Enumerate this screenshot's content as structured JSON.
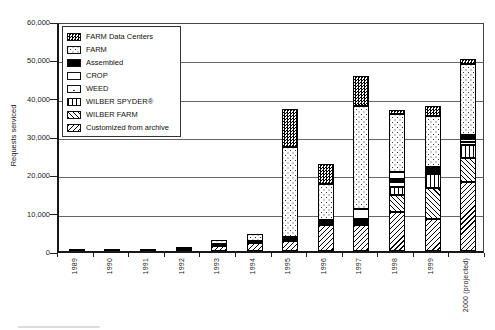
{
  "chart_data": {
    "type": "bar",
    "stacked": true,
    "title": "",
    "xlabel": "",
    "ylabel": "Requests serviced",
    "ylim": [
      0,
      60000
    ],
    "ytick_step": 10000,
    "ytick_labels": [
      "0",
      "10,000",
      "20,000",
      "30,000",
      "40,000",
      "50,000",
      "60,000"
    ],
    "grid": "horizontal",
    "legend_position": "top-left-inside",
    "colors": {
      "ink": "#000000",
      "paper": "#ffffff",
      "gridline": "#666666"
    },
    "categories": [
      "1989",
      "1990",
      "1991",
      "1992",
      "1993",
      "1994",
      "1995",
      "1996",
      "1997",
      "1998",
      "1999",
      "2000 (projected)"
    ],
    "legend": [
      {
        "key": "fdc",
        "label": "FARM Data Centers",
        "pattern": "dark-checker"
      },
      {
        "key": "farm",
        "label": "FARM",
        "pattern": "sparse-dots"
      },
      {
        "key": "assembled",
        "label": "Assembled",
        "pattern": "solid-black"
      },
      {
        "key": "crop",
        "label": "CROP",
        "pattern": "plain-white"
      },
      {
        "key": "weed",
        "label": "WEED",
        "pattern": "very-sparse-dots"
      },
      {
        "key": "spyder",
        "label": "WILBER SPYDER®",
        "pattern": "vertical-lines"
      },
      {
        "key": "wilber_farm",
        "label": "WILBER FARM",
        "pattern": "backslash-hatch"
      },
      {
        "key": "customized",
        "label": "Customized from archive",
        "pattern": "forwardslash-hatch"
      }
    ],
    "bars": [
      {
        "year": "1989",
        "total": 100,
        "segments": [
          {
            "key": "assembled",
            "value": 100
          }
        ]
      },
      {
        "year": "1990",
        "total": 500,
        "segments": [
          {
            "key": "assembled",
            "value": 500
          }
        ]
      },
      {
        "year": "1991",
        "total": 350,
        "segments": [
          {
            "key": "assembled",
            "value": 350
          }
        ]
      },
      {
        "year": "1992",
        "total": 900,
        "segments": [
          {
            "key": "assembled",
            "value": 350
          },
          {
            "key": "fdc",
            "value": 550
          }
        ]
      },
      {
        "year": "1993",
        "total": 2800,
        "segments": [
          {
            "key": "customized",
            "value": 1300
          },
          {
            "key": "assembled",
            "value": 500
          },
          {
            "key": "farm",
            "value": 1000
          }
        ]
      },
      {
        "year": "1994",
        "total": 4500,
        "segments": [
          {
            "key": "customized",
            "value": 2000
          },
          {
            "key": "assembled",
            "value": 500
          },
          {
            "key": "farm",
            "value": 2000
          }
        ]
      },
      {
        "year": "1995",
        "total": 37100,
        "segments": [
          {
            "key": "customized",
            "value": 2700
          },
          {
            "key": "assembled",
            "value": 1000
          },
          {
            "key": "farm",
            "value": 23400
          },
          {
            "key": "fdc",
            "value": 10000
          }
        ]
      },
      {
        "year": "1996",
        "total": 22600,
        "segments": [
          {
            "key": "customized",
            "value": 6900
          },
          {
            "key": "assembled",
            "value": 1100
          },
          {
            "key": "farm",
            "value": 9400
          },
          {
            "key": "fdc",
            "value": 5200
          }
        ]
      },
      {
        "year": "1997",
        "total": 45700,
        "segments": [
          {
            "key": "customized",
            "value": 6900
          },
          {
            "key": "assembled",
            "value": 1500
          },
          {
            "key": "crop",
            "value": 2600
          },
          {
            "key": "farm",
            "value": 26800
          },
          {
            "key": "fdc",
            "value": 7900
          }
        ]
      },
      {
        "year": "1998",
        "total": 36900,
        "segments": [
          {
            "key": "customized",
            "value": 10200
          },
          {
            "key": "wilber_farm",
            "value": 4300
          },
          {
            "key": "spyder",
            "value": 2200
          },
          {
            "key": "weed",
            "value": 1400
          },
          {
            "key": "assembled",
            "value": 700
          },
          {
            "key": "crop",
            "value": 1900
          },
          {
            "key": "farm",
            "value": 15100
          },
          {
            "key": "fdc",
            "value": 1100
          }
        ]
      },
      {
        "year": "1999",
        "total": 37800,
        "segments": [
          {
            "key": "customized",
            "value": 8400
          },
          {
            "key": "wilber_farm",
            "value": 8100
          },
          {
            "key": "spyder",
            "value": 3500
          },
          {
            "key": "weed",
            "value": 500
          },
          {
            "key": "assembled",
            "value": 900
          },
          {
            "key": "crop",
            "value": 600
          },
          {
            "key": "farm",
            "value": 13200
          },
          {
            "key": "fdc",
            "value": 2600
          }
        ]
      },
      {
        "year": "2000 (projected)",
        "total": 50100,
        "segments": [
          {
            "key": "customized",
            "value": 17900
          },
          {
            "key": "wilber_farm",
            "value": 6300
          },
          {
            "key": "spyder",
            "value": 3500
          },
          {
            "key": "weed",
            "value": 800
          },
          {
            "key": "crop",
            "value": 700
          },
          {
            "key": "assembled",
            "value": 1000
          },
          {
            "key": "farm",
            "value": 18500
          },
          {
            "key": "fdc",
            "value": 1400
          }
        ]
      }
    ]
  }
}
